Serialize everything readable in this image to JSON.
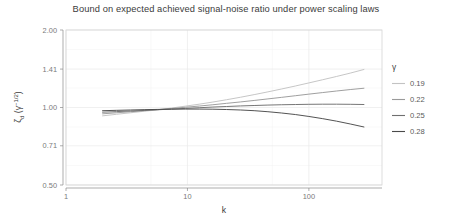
{
  "chart_data": {
    "type": "line",
    "title": "Bound on expected achieved signal-noise ratio under power scaling laws",
    "xlabel": "k",
    "ylabel": "ζ_d (γ^{-1/2})",
    "xscale": "log",
    "yscale": "log",
    "xlim": [
      1,
      400
    ],
    "ylim": [
      0.5,
      2.0
    ],
    "xticks": [
      1,
      10,
      100
    ],
    "xtick_labels": [
      "1",
      "10",
      "100"
    ],
    "yticks": [
      0.5,
      0.71,
      1.0,
      1.41,
      2.0
    ],
    "ytick_labels": [
      "0.50",
      "0.71",
      "1.00",
      "1.41",
      "2.00"
    ],
    "grid": true,
    "legend_position": "right",
    "legend_title": "γ",
    "series": [
      {
        "name": "0.19",
        "color": "#c3c3c3",
        "x": [
          2,
          2.6,
          3.4,
          4.4,
          5.7,
          7.4,
          9.6,
          12.5,
          16.2,
          21,
          27.3,
          35.4,
          46,
          59.6,
          77.4,
          100,
          130,
          169,
          219,
          284
        ],
        "y": [
          0.928,
          0.941,
          0.954,
          0.967,
          0.98,
          0.995,
          1.012,
          1.03,
          1.05,
          1.072,
          1.096,
          1.122,
          1.15,
          1.18,
          1.212,
          1.246,
          1.282,
          1.32,
          1.36,
          1.405
        ]
      },
      {
        "name": "0.22",
        "color": "#9a9a9a",
        "x": [
          2,
          2.6,
          3.4,
          4.4,
          5.7,
          7.4,
          9.6,
          12.5,
          16.2,
          21,
          27.3,
          35.4,
          46,
          59.6,
          77.4,
          100,
          130,
          169,
          219,
          284
        ],
        "y": [
          0.945,
          0.954,
          0.963,
          0.972,
          0.981,
          0.991,
          1.002,
          1.013,
          1.025,
          1.038,
          1.051,
          1.065,
          1.08,
          1.095,
          1.111,
          1.127,
          1.143,
          1.159,
          1.174,
          1.188
        ]
      },
      {
        "name": "0.25",
        "color": "#6f6f6f",
        "x": [
          2,
          2.6,
          3.4,
          4.4,
          5.7,
          7.4,
          9.6,
          12.5,
          16.2,
          21,
          27.3,
          35.4,
          46,
          59.6,
          77.4,
          100,
          130,
          169,
          219,
          284
        ],
        "y": [
          0.959,
          0.964,
          0.969,
          0.974,
          0.98,
          0.986,
          0.992,
          0.998,
          1.004,
          1.009,
          1.014,
          1.018,
          1.022,
          1.025,
          1.027,
          1.029,
          1.03,
          1.03,
          1.029,
          1.027
        ]
      },
      {
        "name": "0.28",
        "color": "#4a4a4a",
        "x": [
          2,
          2.6,
          3.4,
          4.4,
          5.7,
          7.4,
          9.6,
          12.5,
          16.2,
          21,
          27.3,
          35.4,
          46,
          59.6,
          77.4,
          100,
          130,
          169,
          219,
          284
        ],
        "y": [
          0.972,
          0.975,
          0.978,
          0.981,
          0.983,
          0.985,
          0.986,
          0.986,
          0.985,
          0.982,
          0.978,
          0.972,
          0.963,
          0.952,
          0.939,
          0.923,
          0.905,
          0.885,
          0.863,
          0.84
        ]
      }
    ]
  },
  "legend": {
    "title": "γ",
    "entries": [
      "0.19",
      "0.22",
      "0.25",
      "0.28"
    ]
  },
  "axes": {
    "x_title": "k",
    "y_title": "ζ_d (γ^{-1/2})"
  }
}
